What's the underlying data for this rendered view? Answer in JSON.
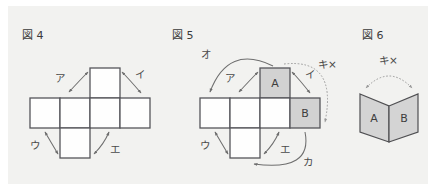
{
  "panel": {
    "background_color": "#f2f2f0",
    "page_background": "#ffffff"
  },
  "figures": [
    {
      "id": "fig4",
      "label": "図 4",
      "type": "cube-net-cross",
      "faces": [
        {
          "name": "top",
          "letter": "",
          "shaded": false
        },
        {
          "name": "left-outer",
          "letter": "",
          "shaded": false
        },
        {
          "name": "left-inner",
          "letter": "",
          "shaded": false
        },
        {
          "name": "center",
          "letter": "",
          "shaded": false
        },
        {
          "name": "right-outer",
          "letter": "",
          "shaded": false
        },
        {
          "name": "bottom",
          "letter": "",
          "shaded": false
        }
      ],
      "arrows": [
        {
          "label": "ア",
          "style": "solid",
          "heads": "double"
        },
        {
          "label": "イ",
          "style": "solid",
          "heads": "double"
        },
        {
          "label": "ウ",
          "style": "solid",
          "heads": "double"
        },
        {
          "label": "エ",
          "style": "solid",
          "heads": "double"
        }
      ]
    },
    {
      "id": "fig5",
      "label": "図 5",
      "type": "cube-net-cross-labeled",
      "faces": [
        {
          "name": "top",
          "letter": "A",
          "shaded": true
        },
        {
          "name": "left-outer",
          "letter": "",
          "shaded": false
        },
        {
          "name": "left-inner",
          "letter": "",
          "shaded": false
        },
        {
          "name": "center",
          "letter": "",
          "shaded": false
        },
        {
          "name": "right-outer",
          "letter": "B",
          "shaded": true
        },
        {
          "name": "bottom",
          "letter": "",
          "shaded": false
        }
      ],
      "arrows": [
        {
          "label": "ア",
          "style": "solid",
          "heads": "double"
        },
        {
          "label": "イ",
          "style": "solid",
          "heads": "double"
        },
        {
          "label": "ウ",
          "style": "solid",
          "heads": "double"
        },
        {
          "label": "エ",
          "style": "solid",
          "heads": "double"
        },
        {
          "label": "オ",
          "style": "solid",
          "heads": "single"
        },
        {
          "label": "カ",
          "style": "solid",
          "heads": "single"
        },
        {
          "label": "キ×",
          "style": "dotted",
          "heads": "single"
        }
      ]
    },
    {
      "id": "fig6",
      "label": "図 6",
      "type": "folded-pair",
      "faces": [
        {
          "name": "left-panel",
          "letter": "A",
          "shaded": true
        },
        {
          "name": "right-panel",
          "letter": "B",
          "shaded": true
        }
      ],
      "arrows": [
        {
          "label": "キ×",
          "style": "dotted",
          "heads": "double"
        }
      ]
    }
  ],
  "colors": {
    "face_fill": "#fefefe",
    "face_shaded_fill": "#d2d2d2",
    "face_stroke": "#55555a",
    "arrow_stroke": "#6e6e6e",
    "dotted_arrow_stroke": "#9a9a9a",
    "text": "#3a3a3a"
  }
}
